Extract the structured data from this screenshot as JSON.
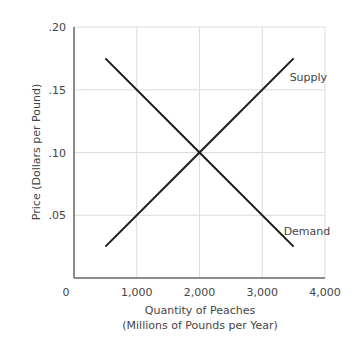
{
  "chart_data": {
    "type": "line",
    "title": "",
    "xlabel": "Quantity of Peaches",
    "xlabel_line2": "(Millions of Pounds per Year)",
    "ylabel": "Price (Dollars per Pound)",
    "xlim": [
      0,
      4000
    ],
    "ylim": [
      0,
      0.2
    ],
    "x_ticks": [
      0,
      1000,
      2000,
      3000,
      4000
    ],
    "x_tick_labels": [
      "0",
      "1,000",
      "2,000",
      "3,000",
      "4,000"
    ],
    "y_ticks": [
      0.05,
      0.1,
      0.15,
      0.2
    ],
    "y_tick_labels": [
      ".05",
      ".10",
      ".15",
      ".20"
    ],
    "grid": true,
    "legend": "inline labels at line ends",
    "series": [
      {
        "name": "Supply",
        "x": [
          500,
          2000,
          3500
        ],
        "y": [
          0.025,
          0.1,
          0.175
        ],
        "color": "#1a1a1a"
      },
      {
        "name": "Demand",
        "x": [
          500,
          2000,
          3500
        ],
        "y": [
          0.175,
          0.1,
          0.025
        ],
        "color": "#1a1a1a"
      }
    ],
    "equilibrium": {
      "quantity": 2000,
      "price": 0.1
    }
  }
}
